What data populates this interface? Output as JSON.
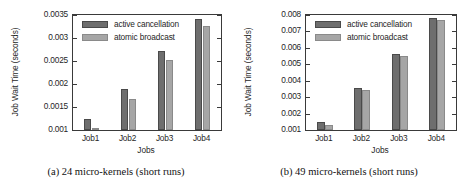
{
  "figure": {
    "panels": [
      {
        "id": "panel-a",
        "caption": "(a)  24 micro-kernels (short runs)",
        "chart_data": {
          "type": "bar",
          "title": "",
          "xlabel": "Jobs",
          "ylabel": "Job Wait Time (seconds)",
          "categories": [
            "Job1",
            "Job2",
            "Job3",
            "Job4"
          ],
          "series": [
            {
              "name": "active cancellation",
              "color": "#6e6e6e",
              "values": [
                0.00123,
                0.00189,
                0.00272,
                0.00342
              ]
            },
            {
              "name": "atomic broadcast",
              "color": "#a6a6a6",
              "values": [
                0.00105,
                0.00167,
                0.00253,
                0.00327
              ]
            }
          ],
          "ylim": [
            0.001,
            0.0035
          ],
          "yticks": [
            "0.001",
            "0.0015",
            "0.002",
            "0.0025",
            "0.003",
            "0.0035"
          ],
          "ytick_values": [
            0.001,
            0.0015,
            0.002,
            0.0025,
            0.003,
            0.0035
          ],
          "grid": false,
          "legend_position": "top-left"
        }
      },
      {
        "id": "panel-b",
        "caption": "(b)  49 micro-kernels (short runs)",
        "chart_data": {
          "type": "bar",
          "title": "",
          "xlabel": "Jobs",
          "ylabel": "Job Wait Time (seconds)",
          "categories": [
            "Job1",
            "Job2",
            "Job3",
            "Job4"
          ],
          "series": [
            {
              "name": "active cancellation",
              "color": "#6e6e6e",
              "values": [
                0.00147,
                0.00357,
                0.00563,
                0.00782
              ]
            },
            {
              "name": "atomic broadcast",
              "color": "#a6a6a6",
              "values": [
                0.0013,
                0.00343,
                0.00548,
                0.00768
              ]
            }
          ],
          "ylim": [
            0.001,
            0.008
          ],
          "yticks": [
            "0.001",
            "0.002",
            "0.003",
            "0.004",
            "0.005",
            "0.006",
            "0.007",
            "0.008"
          ],
          "ytick_values": [
            0.001,
            0.002,
            0.003,
            0.004,
            0.005,
            0.006,
            0.007,
            0.008
          ],
          "grid": false,
          "legend_position": "top-left"
        }
      }
    ]
  }
}
